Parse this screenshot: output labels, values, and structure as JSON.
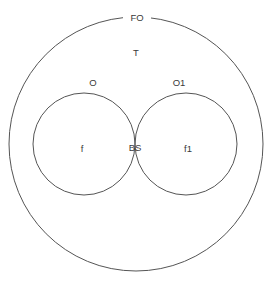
{
  "diagram": {
    "type": "venn",
    "background_color": "#ffffff",
    "stroke_color": "#555555",
    "text_color": "#3a3a3a",
    "universe": {
      "label": "FO",
      "label_position": "top-boundary",
      "center_x": 136,
      "center_y": 144,
      "radius": 127
    },
    "sets": [
      {
        "label": "O",
        "label_position": "top-left-boundary",
        "center_x": 84,
        "center_y": 144,
        "radius": 51
      },
      {
        "label": "O1",
        "label_position": "top-right-boundary",
        "center_x": 186,
        "center_y": 144,
        "radius": 51
      }
    ],
    "regions": [
      {
        "label": "T",
        "meaning": "outside-both-sets",
        "x": 136,
        "y": 53
      },
      {
        "label": "f",
        "meaning": "left-set-only",
        "x": 82,
        "y": 149
      },
      {
        "label": "BS",
        "meaning": "intersection",
        "x": 135,
        "y": 148
      },
      {
        "label": "f1",
        "meaning": "right-set-only",
        "x": 188,
        "y": 149
      }
    ]
  }
}
